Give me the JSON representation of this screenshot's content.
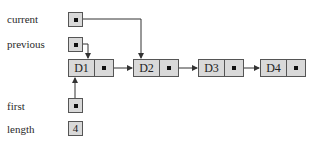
{
  "diagram": {
    "type": "linked-list",
    "variables": [
      {
        "id": "current",
        "label": "current",
        "points_to": "D2"
      },
      {
        "id": "previous",
        "label": "previous",
        "points_to": "D1"
      },
      {
        "id": "first",
        "label": "first",
        "points_to": "D1"
      },
      {
        "id": "length",
        "label": "length",
        "value": "4"
      }
    ],
    "nodes": [
      {
        "id": "D1",
        "label": "D1",
        "next": "D2"
      },
      {
        "id": "D2",
        "label": "D2",
        "next": "D3"
      },
      {
        "id": "D3",
        "label": "D3",
        "next": "D4"
      },
      {
        "id": "D4",
        "label": "D4",
        "next": null
      }
    ],
    "colors": {
      "box_fill": "#d9d9d9",
      "box_border": "#555555",
      "arrow": "#333333"
    }
  }
}
